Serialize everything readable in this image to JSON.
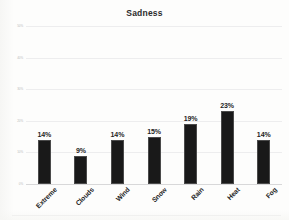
{
  "chart_data": {
    "type": "bar",
    "title": "Sadness",
    "xlabel": "",
    "ylabel": "",
    "categories": [
      "Extreme",
      "Clouds",
      "Wind",
      "Snow",
      "Rain",
      "Heat",
      "Fog"
    ],
    "values": [
      14,
      9,
      14,
      15,
      19,
      23,
      14
    ],
    "data_labels": [
      "14%",
      "9%",
      "14%",
      "15%",
      "19%",
      "23%",
      "14%"
    ],
    "ylim": [
      0,
      50
    ],
    "ytick_labels": [
      "50%",
      "40%",
      "30%",
      "20%",
      "10%",
      "0%"
    ],
    "ytick_values": [
      50,
      40,
      30,
      20,
      10,
      0
    ],
    "grid": true,
    "legend": false,
    "bar_color": "#191919",
    "title_color": "#2b2b2b",
    "gridline_color": "#ededee",
    "background_color": "#fdfdfc"
  }
}
